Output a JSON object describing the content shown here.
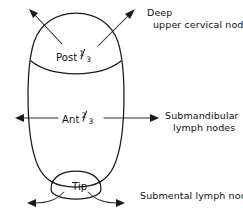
{
  "figure": {
    "regions": [
      {
        "id": "posterior-third",
        "label_text": "Post",
        "fraction_numerator": "1",
        "fraction_denominator": "3",
        "drains_to": "Deep upper cervical nodes"
      },
      {
        "id": "anterior-two-thirds",
        "label_text": "Ant",
        "fraction_numerator": "2",
        "fraction_denominator": "3",
        "drains_to": "Submandibular lymph nodes"
      },
      {
        "id": "tip",
        "label_text": "Tip",
        "fraction_numerator": "",
        "fraction_denominator": "",
        "drains_to": "Submental lymph nodes"
      }
    ],
    "callouts": {
      "deep_upper_cervical": {
        "line1": "Deep",
        "line2": "upper cervical nodes"
      },
      "submandibular": {
        "line1": "Submandibular",
        "line2": "lymph nodes"
      },
      "submental": {
        "line1": "Submental lymph nodes"
      }
    },
    "colors": {
      "ink": "#1a1a1a",
      "background": "#ffffff"
    }
  }
}
